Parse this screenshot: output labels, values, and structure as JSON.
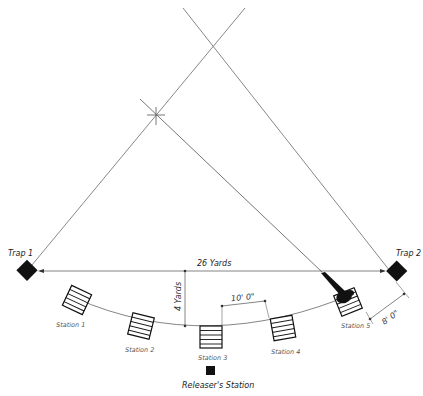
{
  "diagram": {
    "traps": [
      {
        "label": "Trap 1"
      },
      {
        "label": "Trap 2"
      }
    ],
    "stations": [
      {
        "label": "Station 1"
      },
      {
        "label": "Station 2"
      },
      {
        "label": "Station 3"
      },
      {
        "label": "Station 4"
      },
      {
        "label": "Station 5"
      }
    ],
    "releaser_station": "Releaser's Station",
    "dimensions": {
      "trap_distance": "26 Yards",
      "arc_depth": "4 Yards",
      "station_spacing": "10' 0\"",
      "station5_offset": "8' 0\""
    },
    "colors": {
      "line": "#777777",
      "ink": "#111111",
      "background": "#ffffff"
    }
  }
}
